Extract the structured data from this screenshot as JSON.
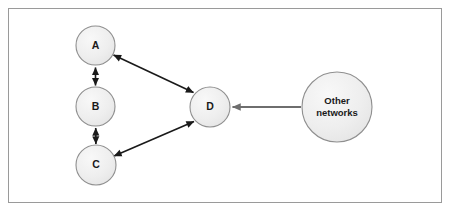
{
  "diagram": {
    "type": "network-topology",
    "title": "",
    "background_color": "#ffffff",
    "frame": {
      "border_color": "#9a9a9a",
      "fill_color": "#ffffff"
    },
    "node_style": {
      "fill_color": "#ececec",
      "fill_highlight": "#f7f7f7",
      "border_color": "#8f8f8f",
      "label_color": "#1a1a1a"
    },
    "edge_style": {
      "dark_color": "#1a1a1a",
      "gray_color": "#6e6e6e"
    },
    "nodes": [
      {
        "id": "A",
        "label": "A",
        "shape": "circle",
        "cx": 95.5,
        "cy": 45.5,
        "r": 19.5
      },
      {
        "id": "B",
        "label": "B",
        "shape": "circle",
        "cx": 95.5,
        "cy": 106.5,
        "r": 19.5
      },
      {
        "id": "C",
        "label": "C",
        "shape": "circle",
        "cx": 96.0,
        "cy": 165.0,
        "r": 20.0
      },
      {
        "id": "D",
        "label": "D",
        "shape": "circle",
        "cx": 210.0,
        "cy": 107.0,
        "r": 20.0
      },
      {
        "id": "OTHER",
        "label": "Other networks",
        "label_lines": [
          "Other",
          "networks"
        ],
        "shape": "circle",
        "cx": 337.0,
        "cy": 107.0,
        "r": 35.0
      }
    ],
    "edges": [
      {
        "id": "a-b",
        "from": "A",
        "to": "B",
        "arrow": "double",
        "color": "#1a1a1a",
        "width": 1.6
      },
      {
        "id": "b-c",
        "from": "B",
        "to": "C",
        "arrow": "double",
        "color": "#1a1a1a",
        "width": 1.6
      },
      {
        "id": "a-d",
        "from": "A",
        "to": "D",
        "arrow": "double",
        "color": "#1a1a1a",
        "width": 1.6
      },
      {
        "id": "c-d",
        "from": "C",
        "to": "D",
        "arrow": "double",
        "color": "#1a1a1a",
        "width": 1.6
      },
      {
        "id": "other-d",
        "from": "OTHER",
        "to": "D",
        "arrow": "single",
        "color": "#6e6e6e",
        "width": 1.8
      }
    ]
  }
}
